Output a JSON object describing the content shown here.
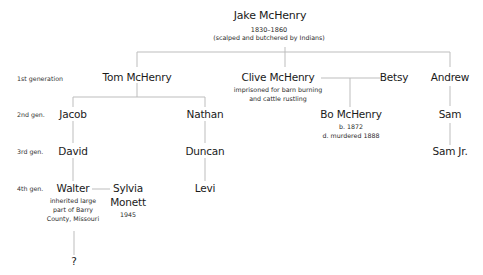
{
  "diagram": {
    "type": "family-tree",
    "root": {
      "name": "Jake McHenry",
      "dates": "1830–1860",
      "note": "(scalped and butchered by Indians)"
    },
    "generation_labels": [
      "1st generation",
      "2nd gen.",
      "3rd gen.",
      "4th gen."
    ],
    "people": {
      "tom": {
        "name": "Tom McHenry"
      },
      "clive": {
        "name": "Clive McHenry",
        "note_line1": "imprisoned for barn burning",
        "note_line2": "and cattle rustling"
      },
      "betsy": {
        "name": "Betsy"
      },
      "andrew": {
        "name": "Andrew"
      },
      "jacob": {
        "name": "Jacob"
      },
      "nathan": {
        "name": "Nathan"
      },
      "bo": {
        "name": "Bo McHenry",
        "born": "b. 1872",
        "died": "d. murdered 1888"
      },
      "sam": {
        "name": "Sam"
      },
      "david": {
        "name": "David"
      },
      "duncan": {
        "name": "Duncan"
      },
      "sam_jr": {
        "name": "Sam Jr."
      },
      "walter": {
        "name": "Walter",
        "note_line1": "inherited large",
        "note_line2": "part of Barry",
        "note_line3": "County, Missouri"
      },
      "sylvia": {
        "name_line1": "Sylvia",
        "name_line2": "Monett",
        "date": "1945"
      },
      "levi": {
        "name": "Levi"
      },
      "unknown": {
        "name": "?"
      }
    },
    "relationships": [
      {
        "parent": "Jake McHenry",
        "children": [
          "Tom McHenry",
          "Clive McHenry",
          "Andrew"
        ]
      },
      {
        "parent": "Tom McHenry",
        "children": [
          "Jacob",
          "Nathan"
        ]
      },
      {
        "couple": [
          "Clive McHenry",
          "Betsy"
        ],
        "children": [
          "Bo McHenry"
        ]
      },
      {
        "parent": "Andrew",
        "children": [
          "Sam"
        ]
      },
      {
        "parent": "Jacob",
        "children": [
          "David"
        ]
      },
      {
        "parent": "Nathan",
        "children": [
          "Duncan"
        ]
      },
      {
        "parent": "Sam",
        "children": [
          "Sam Jr."
        ]
      },
      {
        "parent": "David",
        "children": [
          "Walter"
        ]
      },
      {
        "parent": "Duncan",
        "children": [
          "Levi"
        ]
      },
      {
        "couple": [
          "Walter",
          "Sylvia Monett"
        ],
        "children": [
          "?"
        ]
      }
    ],
    "line_color": "#bdbdbd"
  }
}
